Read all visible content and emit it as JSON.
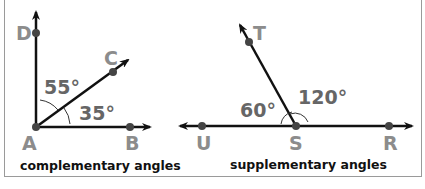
{
  "colors": {
    "line": "#111111",
    "point": "#444444",
    "point_label": "#8c8c8c",
    "angle_label": "#666666",
    "border": "#9a9a9a"
  },
  "complementary": {
    "caption": "complementary angles",
    "points": {
      "D": "D",
      "C": "C",
      "A": "A",
      "B": "B"
    },
    "angles": {
      "DAC": "55°",
      "CAB": "35°"
    }
  },
  "supplementary": {
    "caption": "supplementary angles",
    "points": {
      "T": "T",
      "U": "U",
      "S": "S",
      "R": "R"
    },
    "angles": {
      "UST": "60°",
      "TSR": "120°"
    }
  }
}
